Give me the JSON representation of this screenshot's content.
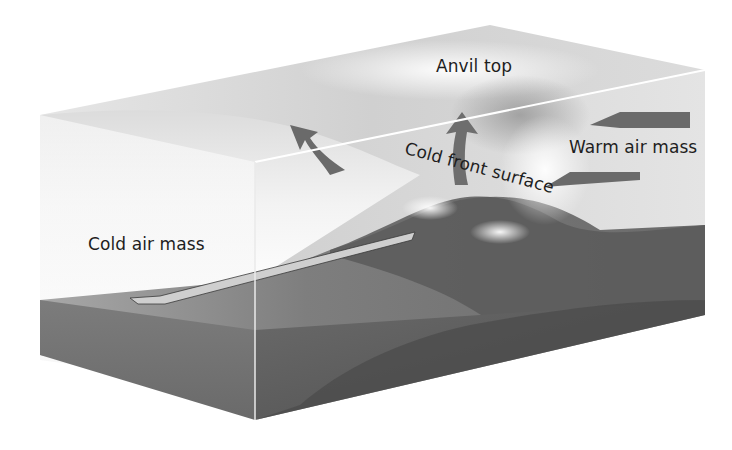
{
  "diagram": {
    "labels": {
      "anvil_top": "Anvil top",
      "warm_air_mass": "Warm air mass",
      "cold_front_surface": "Cold front surface",
      "cold_air_mass": "Cold air mass"
    },
    "colors": {
      "background": "#ffffff",
      "box_top": "#d9d9d9",
      "cold_air": "#f2f2f2",
      "ground_top": "#7a7a7a",
      "ground_side": "#5e5e5e",
      "mountain": "#4f4f4f",
      "arrow_dark": "#6a6a6a",
      "arrow_light": "#cfcfcf",
      "text": "#1e1e1e"
    }
  }
}
